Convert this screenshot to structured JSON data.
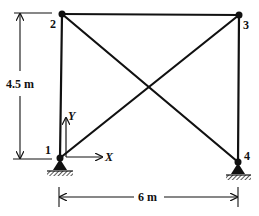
{
  "diagram": {
    "type": "truss-frame",
    "nodes": [
      {
        "id": "1",
        "label": "1",
        "x": 60,
        "y": 158
      },
      {
        "id": "2",
        "label": "2",
        "x": 62,
        "y": 14
      },
      {
        "id": "3",
        "label": "3",
        "x": 239,
        "y": 15
      },
      {
        "id": "4",
        "label": "4",
        "x": 238,
        "y": 162
      }
    ],
    "members": [
      {
        "from": "1",
        "to": "2"
      },
      {
        "from": "2",
        "to": "3"
      },
      {
        "from": "3",
        "to": "4"
      },
      {
        "from": "1",
        "to": "3"
      },
      {
        "from": "2",
        "to": "4"
      }
    ],
    "supports": [
      {
        "node": "1",
        "type": "pin"
      },
      {
        "node": "4",
        "type": "pin"
      }
    ],
    "dimensions": {
      "height": {
        "label": "4.5 m"
      },
      "width": {
        "label": "6 m"
      }
    },
    "axes": {
      "x_label": "X",
      "y_label": "Y"
    },
    "colors": {
      "line": "#111111",
      "background": "#ffffff"
    }
  }
}
